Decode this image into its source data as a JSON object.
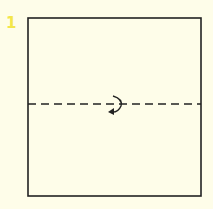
{
  "diagram": {
    "step_number": "1",
    "shape": "square",
    "fold_line": "dashed-horizontal-middle",
    "fold_symbol": "rotate-arrow-icon",
    "colors": {
      "background": "#fefde9",
      "stroke": "#222222",
      "step_number": "#f3e64a"
    }
  }
}
